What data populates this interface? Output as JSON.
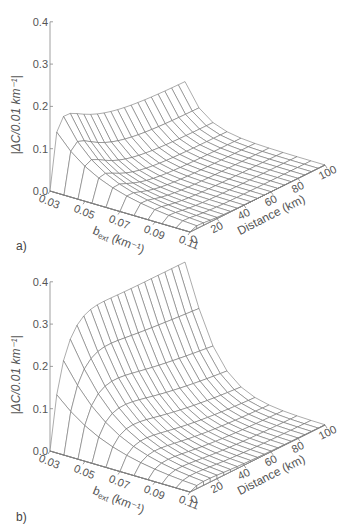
{
  "chart_data": [
    {
      "type": "surface",
      "panel_label": "a)",
      "zlabel": "|ΔC/0.01 km⁻¹|",
      "xlabel": "bₑₓₜ (km⁻¹)",
      "xlabel_main": "b",
      "xlabel_sub": "ext",
      "xlabel_unit": "(km⁻¹)",
      "ylabel": "Distance (km)",
      "z_ticks": [
        "0.0",
        "0.1",
        "0.2",
        "0.3",
        "0.4"
      ],
      "b_ticks": [
        "0.03",
        "0.05",
        "0.07",
        "0.09",
        "0.11"
      ],
      "distance_ticks": [
        "0",
        "20",
        "40",
        "60",
        "80",
        "100"
      ],
      "zlim": [
        0,
        0.4
      ],
      "b_range": [
        0.03,
        0.11
      ],
      "distance_range": [
        0,
        100
      ],
      "peak_value": 0.235,
      "peak_location": {
        "b": 0.03,
        "distance_km": 8
      },
      "far_edge_value_b003": 0.1,
      "description": "Sharp peak (~0.235) at short distance and low b_ext, decaying with distance toward ~0.1 at 100 km for b=0.03 and near 0 for b>=0.07",
      "model": {
        "A": 0.235,
        "plateau": 0.42,
        "rise": 5.0,
        "decayB": 33.0,
        "shape": "peaked"
      }
    },
    {
      "type": "surface",
      "panel_label": "b)",
      "zlabel": "|ΔC/0.01 km⁻¹|",
      "xlabel": "bₑₓₜ (km⁻¹)",
      "xlabel_main": "b",
      "xlabel_sub": "ext",
      "xlabel_unit": "(km⁻¹)",
      "ylabel": "Distance (km)",
      "z_ticks": [
        "0.0",
        "0.1",
        "0.2",
        "0.3",
        "0.4"
      ],
      "b_ticks": [
        "0.03",
        "0.05",
        "0.07",
        "0.09",
        "0.11"
      ],
      "distance_ticks": [
        "0",
        "20",
        "40",
        "60",
        "80",
        "100"
      ],
      "zlim": [
        0,
        0.4
      ],
      "b_range": [
        0.03,
        0.11
      ],
      "distance_range": [
        0,
        100
      ],
      "peak_value": 0.29,
      "peak_location": {
        "b": 0.03,
        "distance_km": 25
      },
      "far_edge_value_b003": 0.27,
      "description": "Broad plateau (~0.29) at b=0.03 sustained out to 100 km (~0.27), decaying with increasing b_ext and with distance for larger b",
      "model": {
        "A": 0.29,
        "plateau": 0.93,
        "rise": 9.0,
        "decayB": 33.0,
        "shape": "plateau"
      }
    }
  ],
  "panels": {
    "a": {
      "label": "a)"
    },
    "b": {
      "label": "b)"
    }
  }
}
